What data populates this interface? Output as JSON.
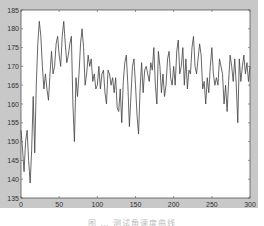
{
  "chart_data": {
    "type": "line",
    "title": "",
    "xlabel": "",
    "ylabel": "",
    "xlim": [
      0,
      300
    ],
    "ylim": [
      135,
      185
    ],
    "grid": false,
    "legend": "none",
    "xticks": [
      0,
      50,
      100,
      150,
      200,
      250,
      300
    ],
    "yticks": [
      135,
      140,
      145,
      150,
      155,
      160,
      165,
      170,
      175,
      180,
      185
    ],
    "xtick_labels": [
      "0",
      "50",
      "100",
      "150",
      "200",
      "250",
      "300"
    ],
    "ytick_labels": [
      "135",
      "140",
      "145",
      "150",
      "155",
      "160",
      "165",
      "170",
      "175",
      "180",
      "185"
    ],
    "series": [
      {
        "name": "angular velocity",
        "color": "#404040",
        "x": [
          0,
          2,
          4,
          6,
          8,
          10,
          12,
          14,
          16,
          18,
          20,
          22,
          24,
          26,
          28,
          30,
          32,
          34,
          36,
          38,
          40,
          42,
          44,
          46,
          48,
          50,
          52,
          54,
          56,
          58,
          60,
          62,
          64,
          66,
          68,
          70,
          72,
          74,
          76,
          78,
          80,
          82,
          84,
          86,
          88,
          90,
          92,
          94,
          96,
          98,
          100,
          102,
          104,
          106,
          108,
          110,
          112,
          114,
          116,
          118,
          120,
          122,
          124,
          126,
          128,
          130,
          132,
          134,
          136,
          138,
          140,
          142,
          144,
          146,
          148,
          150,
          152,
          154,
          156,
          158,
          160,
          162,
          164,
          166,
          168,
          170,
          172,
          174,
          176,
          178,
          180,
          182,
          184,
          186,
          188,
          190,
          192,
          194,
          196,
          198,
          200,
          202,
          204,
          206,
          208,
          210,
          212,
          214,
          216,
          218,
          220,
          222,
          224,
          226,
          228,
          230,
          232,
          234,
          236,
          238,
          240,
          242,
          244,
          246,
          248,
          250,
          252,
          254,
          256,
          258,
          260,
          262,
          264,
          266,
          268,
          270,
          272,
          274,
          276,
          278,
          280,
          282,
          284,
          286,
          288,
          290,
          292,
          294,
          296,
          298,
          300
        ],
        "values": [
          153,
          148,
          142,
          150,
          153,
          145,
          139,
          148,
          162,
          147,
          165,
          176,
          182,
          178,
          170,
          164,
          168,
          164,
          161,
          168,
          174,
          168,
          170,
          176,
          178,
          173,
          170,
          178,
          182,
          176,
          171,
          173,
          176,
          178,
          160,
          150,
          167,
          162,
          168,
          176,
          180,
          175,
          165,
          168,
          173,
          170,
          172,
          166,
          168,
          164,
          165,
          170,
          164,
          168,
          169,
          163,
          160,
          169,
          168,
          165,
          167,
          163,
          167,
          159,
          158,
          164,
          155,
          166,
          171,
          173,
          165,
          154,
          162,
          170,
          172,
          165,
          157,
          152,
          164,
          171,
          163,
          169,
          170,
          168,
          166,
          171,
          169,
          175,
          165,
          160,
          174,
          170,
          163,
          168,
          162,
          165,
          172,
          174,
          167,
          165,
          170,
          165,
          174,
          177,
          168,
          170,
          175,
          165,
          172,
          164,
          169,
          168,
          175,
          178,
          170,
          168,
          172,
          176,
          173,
          164,
          166,
          160,
          167,
          163,
          170,
          175,
          168,
          165,
          167,
          165,
          172,
          170,
          168,
          160,
          165,
          158,
          166,
          173,
          170,
          166,
          172,
          165,
          155,
          172,
          166,
          170,
          173,
          168,
          171,
          166,
          170
        ]
      }
    ]
  },
  "caption": "图 … 测试角速度曲线"
}
